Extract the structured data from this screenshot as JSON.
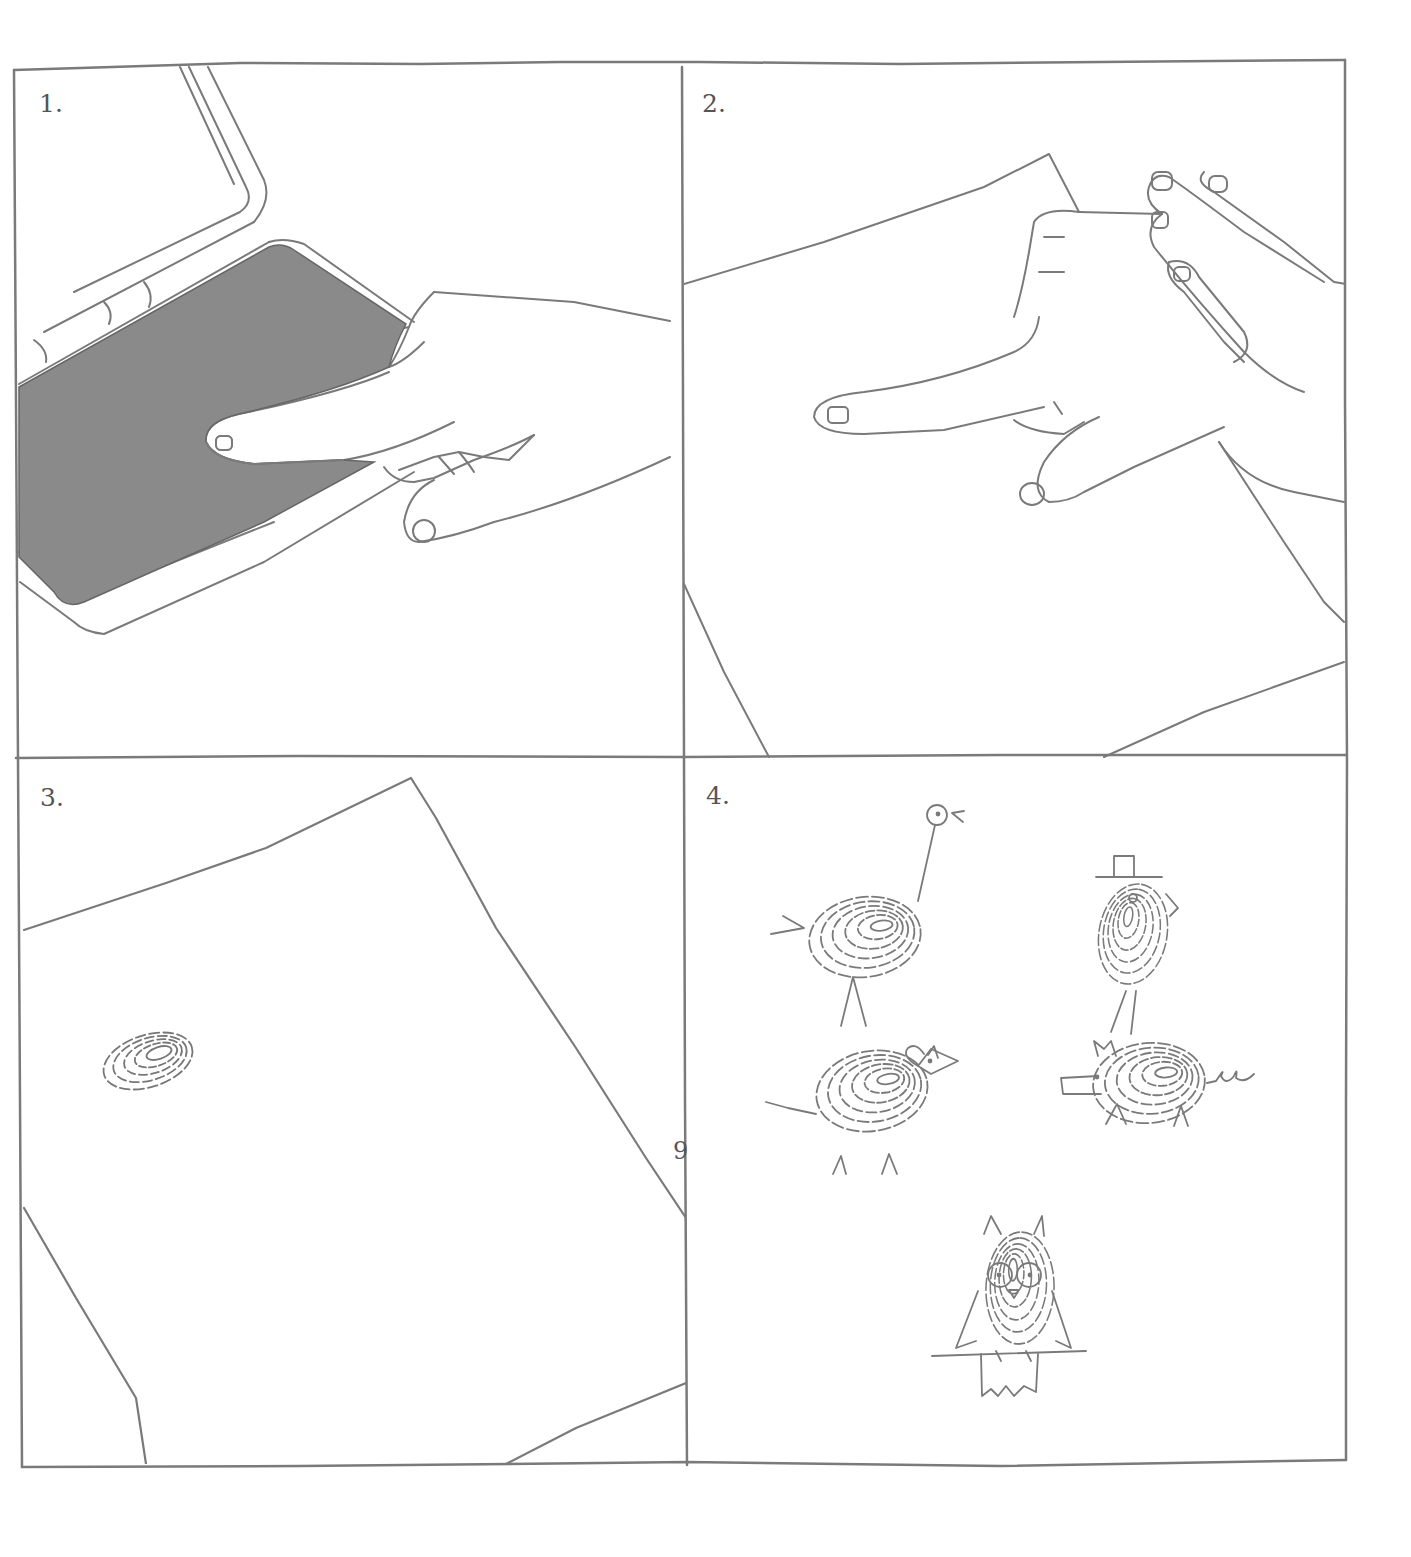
{
  "page": {
    "page_number": "9",
    "ink_color": "#7a7a7a",
    "pad_color": "#8a8a8a"
  },
  "panels": [
    {
      "number": "1.",
      "scene": "finger pressed on open ink pad"
    },
    {
      "number": "2.",
      "scene": "inked finger pressed onto sheet of paper"
    },
    {
      "number": "3.",
      "scene": "single fingerprint left on paper"
    },
    {
      "number": "4.",
      "scene": "fingerprints turned into animal drawings",
      "figures": [
        "ostrich",
        "bird-with-top-hat",
        "mouse",
        "pig",
        "owl-on-branch"
      ]
    }
  ]
}
